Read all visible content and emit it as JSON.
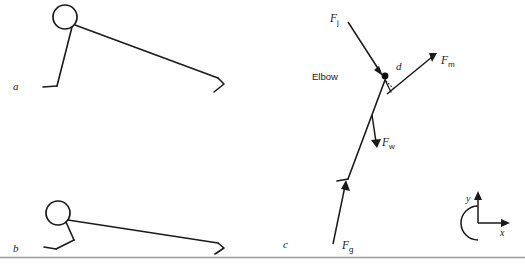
{
  "figure": {
    "background_color": "#ffffff",
    "stroke_color": "#1a1a1a",
    "rule_color": "#9a9a9a"
  },
  "panels": [
    {
      "id": "a",
      "label": "a",
      "description": "Stick figure in push-up with elbow extended (top position)"
    },
    {
      "id": "b",
      "label": "b",
      "description": "Stick figure in push-up with elbow flexed (bottom position)"
    },
    {
      "id": "c",
      "label": "c",
      "description": "Free-body diagram of forces acting about the elbow joint"
    }
  ],
  "free_body": {
    "joint_label": "Elbow",
    "moment_arm_label": "d",
    "forces": [
      {
        "key": "Fj",
        "symbol": "F",
        "subscript": "j",
        "name": "joint-reaction-force",
        "direction": "down-right toward elbow"
      },
      {
        "key": "Fm",
        "symbol": "F",
        "subscript": "m",
        "name": "muscle-force",
        "direction": "up-right away from elbow"
      },
      {
        "key": "Fw",
        "symbol": "F",
        "subscript": "w",
        "name": "forearm-weight-force",
        "direction": "downward"
      },
      {
        "key": "Fg",
        "symbol": "F",
        "subscript": "g",
        "name": "ground-reaction-force",
        "direction": "upward along forearm"
      }
    ]
  },
  "axes_key": {
    "name": "coordinate-system-key",
    "x_label": "x",
    "y_label": "y",
    "rotation": "counterclockwise positive"
  }
}
